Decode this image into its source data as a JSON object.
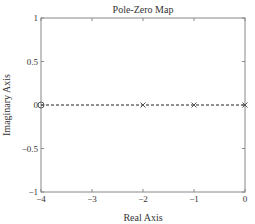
{
  "chart_data": {
    "type": "scatter",
    "title": "Pole-Zero Map",
    "xlabel": "Real Axis",
    "ylabel": "Imaginary Axis",
    "xlim": [
      -4,
      0
    ],
    "ylim": [
      -1,
      1
    ],
    "xticks": [
      -4,
      -3,
      -2,
      -1,
      0
    ],
    "xtick_labels": [
      "−4",
      "−3",
      "−2",
      "−1",
      "0"
    ],
    "yticks": [
      -1,
      -0.5,
      0,
      0.5,
      1
    ],
    "ytick_labels": [
      "−1",
      "−0.5",
      "0",
      "0.5",
      "1"
    ],
    "grid": false,
    "zeros": [
      {
        "re": -4,
        "im": 0
      }
    ],
    "poles": [
      {
        "re": -2,
        "im": 0
      },
      {
        "re": -1,
        "im": 0
      },
      {
        "re": 0,
        "im": 0
      }
    ],
    "reference_line": {
      "style": "dashed",
      "axis": "imaginary",
      "value": 0
    },
    "colors": {
      "axes": "#888888",
      "markers": "#555555",
      "dashed_line": "#222222",
      "text": "#333333"
    }
  }
}
